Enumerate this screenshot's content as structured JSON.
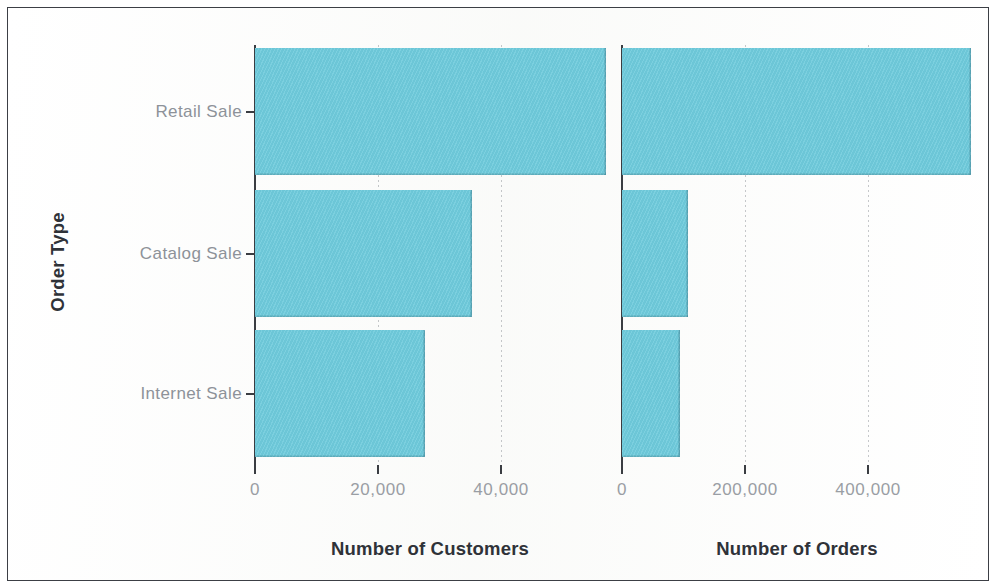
{
  "chart_data": {
    "type": "bar",
    "orientation": "horizontal",
    "title": "",
    "ylabel": "Order Type",
    "categories": [
      "Retail Sale",
      "Catalog Sale",
      "Internet Sale"
    ],
    "grid": true,
    "legend": "none",
    "bar_color": "#6FCBDC",
    "panels": [
      {
        "xlabel": "Number of Customers",
        "xlim": [
          0,
          60000
        ],
        "ticks": [
          0,
          20000,
          40000
        ],
        "tick_labels": [
          "0",
          "20,000",
          "40,000"
        ],
        "values": [
          57000,
          35300,
          27600
        ]
      },
      {
        "xlabel": "Number of Orders",
        "xlim": [
          0,
          580000
        ],
        "ticks": [
          0,
          200000,
          400000
        ],
        "tick_labels": [
          "0",
          "200,000",
          "400,000"
        ],
        "values": [
          567000,
          107000,
          94000
        ]
      }
    ]
  },
  "axes": {
    "y_title": "Order Type",
    "categories": [
      {
        "label": "Retail Sale"
      },
      {
        "label": "Catalog Sale"
      },
      {
        "label": "Internet Sale"
      }
    ],
    "left": {
      "title": "Number of Customers",
      "tick_labels": [
        "0",
        "20,000",
        "40,000"
      ]
    },
    "right": {
      "title": "Number of Orders",
      "tick_labels": [
        "0",
        "200,000",
        "400,000"
      ]
    }
  }
}
